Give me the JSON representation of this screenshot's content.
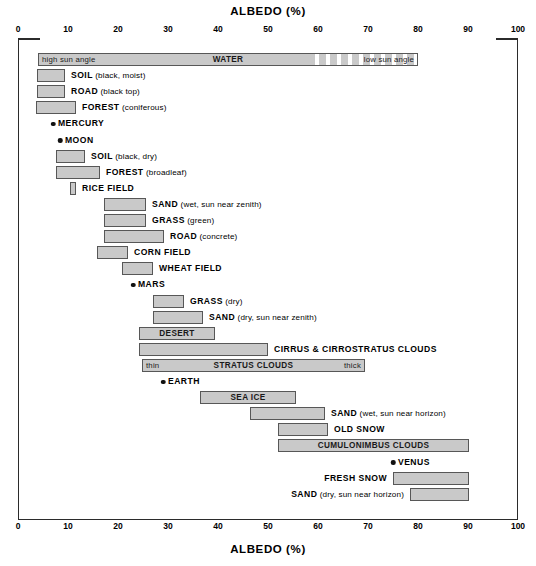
{
  "chart_data": {
    "type": "bar",
    "title": "ALBEDO (%)",
    "xlabel": "ALBEDO (%)",
    "ylabel": "",
    "xlim": [
      0,
      100
    ],
    "grid": false,
    "legend": "none",
    "orientation": "horizontal-range",
    "tick_labels": [
      "0",
      "10",
      "20",
      "30",
      "40",
      "50",
      "60",
      "70",
      "80",
      "90",
      "100"
    ],
    "ticks": [
      0,
      10,
      20,
      30,
      40,
      50,
      60,
      70,
      80,
      90,
      100
    ],
    "axis_title_top": "ALBEDO (%)",
    "axis_title_bottom": "ALBEDO (%)",
    "bar_fill_color": "#c9c9c9",
    "bar_border_color": "#575757",
    "marker_color": "#111111",
    "items": [
      {
        "name": "WATER",
        "label": "WATER",
        "label_sub": "",
        "type": "range",
        "start": 4,
        "end": 80,
        "dashed_from": 58,
        "inner_label_left": "high sun angle",
        "inner_label_center": "WATER",
        "inner_label_right": "low sun angle"
      },
      {
        "name": "SOIL (black, moist)",
        "label": "SOIL",
        "label_sub": "(black, moist)",
        "type": "range",
        "start": 3.8,
        "end": 9.4
      },
      {
        "name": "ROAD (black top)",
        "label": "ROAD",
        "label_sub": "(black top)",
        "type": "range",
        "start": 3.8,
        "end": 9.4
      },
      {
        "name": "FOREST (coniferous)",
        "label": "FOREST",
        "label_sub": "(coniferous)",
        "type": "range",
        "start": 3.6,
        "end": 11.6
      },
      {
        "name": "MERCURY",
        "label": "MERCURY",
        "label_sub": "",
        "type": "point",
        "value": 7
      },
      {
        "name": "MOON",
        "label": "MOON",
        "label_sub": "",
        "type": "point",
        "value": 8.4
      },
      {
        "name": "SOIL (black, dry)",
        "label": "SOIL",
        "label_sub": "(black, dry)",
        "type": "range",
        "start": 7.6,
        "end": 13.4
      },
      {
        "name": "FOREST (broadleaf)",
        "label": "FOREST",
        "label_sub": "(broadleaf)",
        "type": "range",
        "start": 7.6,
        "end": 16.4
      },
      {
        "name": "RICE FIELD",
        "label": "RICE FIELD",
        "label_sub": "",
        "type": "range",
        "start": 10.4,
        "end": 11.6
      },
      {
        "name": "SAND (wet, sun near zenith)",
        "label": "SAND",
        "label_sub": "(wet, sun near zenith)",
        "type": "range",
        "start": 17.2,
        "end": 25.6
      },
      {
        "name": "GRASS (green)",
        "label": "GRASS",
        "label_sub": "(green)",
        "type": "range",
        "start": 17.2,
        "end": 25.6
      },
      {
        "name": "ROAD (concrete)",
        "label": "ROAD",
        "label_sub": "(concrete)",
        "type": "range",
        "start": 17.2,
        "end": 29.2
      },
      {
        "name": "CORN FIELD",
        "label": "CORN FIELD",
        "label_sub": "",
        "type": "range",
        "start": 15.8,
        "end": 22.0
      },
      {
        "name": "WHEAT FIELD",
        "label": "WHEAT FIELD",
        "label_sub": "",
        "type": "range",
        "start": 20.8,
        "end": 27.0
      },
      {
        "name": "MARS",
        "label": "MARS",
        "label_sub": "",
        "type": "point",
        "value": 23
      },
      {
        "name": "GRASS (dry)",
        "label": "GRASS",
        "label_sub": "(dry)",
        "type": "range",
        "start": 27.0,
        "end": 33.2
      },
      {
        "name": "SAND (dry, sun near zenith)",
        "label": "SAND",
        "label_sub": "(dry, sun near zenith)",
        "type": "range",
        "start": 27.0,
        "end": 37.0
      },
      {
        "name": "DESERT",
        "label": "DESERT",
        "label_sub": "",
        "type": "range",
        "start": 24.2,
        "end": 39.4,
        "inner_label_center": "DESERT"
      },
      {
        "name": "CIRRUS & CIRROSTRATUS CLOUDS",
        "label": "CIRRUS & CIRROSTRATUS CLOUDS",
        "label_sub": "",
        "type": "range",
        "start": 24.2,
        "end": 50.0
      },
      {
        "name": "STRATUS CLOUDS",
        "label": "STRATUS CLOUDS",
        "label_sub": "",
        "type": "range",
        "start": 24.8,
        "end": 69.4,
        "inner_label_left": "thin",
        "inner_label_center": "STRATUS CLOUDS",
        "inner_label_right": "thick"
      },
      {
        "name": "EARTH",
        "label": "EARTH",
        "label_sub": "",
        "type": "point",
        "value": 29
      },
      {
        "name": "SEA ICE",
        "label": "SEA ICE",
        "label_sub": "",
        "type": "range",
        "start": 36.4,
        "end": 55.6,
        "inner_label_center": "SEA ICE"
      },
      {
        "name": "SAND (wet, sun near horizon)",
        "label": "SAND",
        "label_sub": "(wet, sun near horizon)",
        "type": "range",
        "start": 46.4,
        "end": 61.4
      },
      {
        "name": "OLD SNOW",
        "label": "OLD SNOW",
        "label_sub": "",
        "type": "range",
        "start": 52.0,
        "end": 62.0
      },
      {
        "name": "CUMULONIMBUS CLOUDS",
        "label": "CUMULONIMBUS CLOUDS",
        "label_sub": "",
        "type": "range",
        "start": 52.0,
        "end": 90.2,
        "inner_label_center": "CUMULONIMBUS CLOUDS"
      },
      {
        "name": "VENUS",
        "label": "VENUS",
        "label_sub": "",
        "type": "point",
        "value": 75
      },
      {
        "name": "FRESH SNOW",
        "label": "FRESH SNOW",
        "label_sub": "",
        "type": "range",
        "start": 75.0,
        "end": 90.2,
        "label_side": "left"
      },
      {
        "name": "SAND (dry, sun near horizon)",
        "label": "SAND",
        "label_sub": "(dry, sun near horizon)",
        "type": "range",
        "start": 78.4,
        "end": 90.2,
        "label_side": "left"
      }
    ]
  }
}
